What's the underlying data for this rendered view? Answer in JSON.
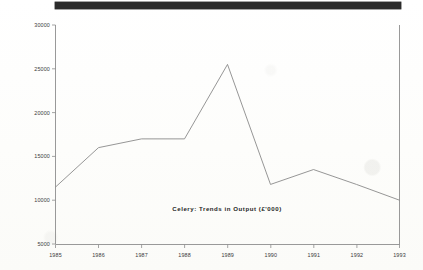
{
  "document": {
    "redaction_bar_present": true,
    "background_color": "#fdfdfc",
    "ink_color": "#8a8a8a"
  },
  "chart_data": {
    "type": "line",
    "title": "Celery:  Trends  in  Output  (£'000)",
    "xlabel": "",
    "ylabel": "",
    "categories": [
      "1985",
      "1986",
      "1987",
      "1988",
      "1989",
      "1990",
      "1991",
      "1992",
      "1993"
    ],
    "x": [
      1985,
      1986,
      1987,
      1988,
      1989,
      1990,
      1991,
      1992,
      1993
    ],
    "values": [
      11500,
      16000,
      17000,
      17000,
      25500,
      11800,
      13500,
      11800,
      10000
    ],
    "series": [
      {
        "name": "Celery output",
        "values": [
          11500,
          16000,
          17000,
          17000,
          25500,
          11800,
          13500,
          11800,
          10000
        ]
      }
    ],
    "ylim": [
      5000,
      30000
    ],
    "ytick_labels": [
      "30000",
      "25000",
      "20000",
      "15000",
      "10000",
      "5000"
    ],
    "ytick_values": [
      30000,
      25000,
      20000,
      15000,
      10000,
      5000
    ],
    "xtick_labels": [
      "1985",
      "1986",
      "1987",
      "1988",
      "1989",
      "1990",
      "1991",
      "1992",
      "1993"
    ],
    "xlim": [
      1985,
      1993
    ],
    "grid": false,
    "legend": false,
    "legend_position": "none",
    "title_position": "inside-bottom-center",
    "line_color": "#8a8a8a"
  }
}
